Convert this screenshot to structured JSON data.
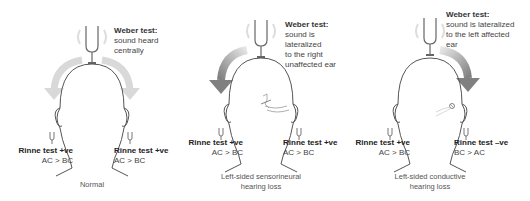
{
  "panels": [
    {
      "id": "normal",
      "weber": {
        "title": "Weber test:",
        "lines": [
          "sound heard",
          "centrally"
        ]
      },
      "rinne_left": {
        "title": "Rinne test +ve",
        "result": "AC > BC"
      },
      "rinne_right": {
        "title": "Rinne test +ve",
        "result": "AC > BC"
      },
      "caption": [
        "Normal"
      ]
    },
    {
      "id": "left-sensorineural",
      "weber": {
        "title": "Weber test:",
        "lines": [
          "sound is",
          "lateralized",
          "to the right",
          "unaffected ear"
        ]
      },
      "rinne_left": {
        "title": "Rinne test +ve",
        "result": "AC > BC"
      },
      "rinne_right": {
        "title": "Rinne test +ve",
        "result": "AC > BC"
      },
      "caption": [
        "Left-sided sensorineural",
        "hearing loss"
      ]
    },
    {
      "id": "left-conductive",
      "weber": {
        "title": "Weber test:",
        "lines": [
          "sound is lateralized",
          "to the left affected",
          "ear"
        ]
      },
      "rinne_left": {
        "title": "Rinne test +ve",
        "result": "AC > BC"
      },
      "rinne_right": {
        "title": "Rinne test –ve",
        "result": "BC > AC"
      },
      "caption": [
        "Left-sided conductive",
        "hearing loss"
      ]
    }
  ],
  "colors": {
    "line": "#555555",
    "arrow_light": "#d6d6d6",
    "arrow_dark": "#8a8a8a"
  }
}
